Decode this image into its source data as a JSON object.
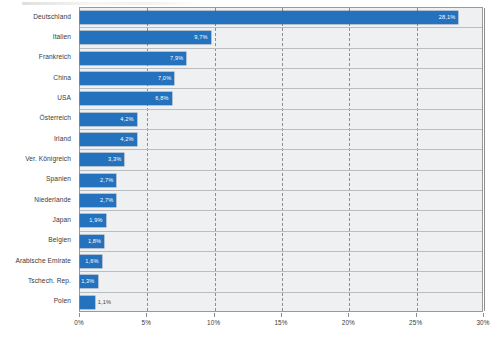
{
  "chart_data": {
    "type": "bar",
    "orientation": "horizontal",
    "title": "",
    "subtitle": "",
    "xlabel": "",
    "ylabel": "",
    "xlim": [
      0,
      30
    ],
    "grid": true,
    "legend": null,
    "value_suffix": "%",
    "decimal_separator": ",",
    "categories": [
      "Deutschland",
      "Italien",
      "Frankreich",
      "China",
      "USA",
      "Österreich",
      "Irland",
      "Ver. Königreich",
      "Spanien",
      "Niederlande",
      "Japan",
      "Belgien",
      "Arabische Emirate",
      "Tschech. Rep.",
      "Polen"
    ],
    "values": [
      28.1,
      9.7,
      7.9,
      7.0,
      6.8,
      4.2,
      4.2,
      3.3,
      2.7,
      2.7,
      1.9,
      1.8,
      1.6,
      1.3,
      1.1
    ],
    "value_labels": [
      "28,1%",
      "9,7%",
      "7,9%",
      "7,0%",
      "6,8%",
      "4,2%",
      "4,2%",
      "3,3%",
      "2,7%",
      "2,7%",
      "1,9%",
      "1,8%",
      "1,6%",
      "1,3%",
      "1,1%"
    ],
    "label_placement": [
      "inside",
      "inside",
      "inside",
      "inside",
      "inside",
      "inside",
      "inside",
      "inside",
      "inside",
      "inside",
      "inside",
      "inside",
      "inside",
      "inside",
      "outside"
    ],
    "xticks": [
      0,
      5,
      10,
      15,
      20,
      25,
      30
    ],
    "xtick_labels": [
      "0%",
      "5%",
      "10%",
      "15%",
      "20%",
      "25%",
      "30%"
    ],
    "colors": {
      "bar": "#2471bd",
      "plot_background": "#eff0f1",
      "gridline": "#8e8e8e",
      "row_separator": "#b9bcc0",
      "axis_text": "#3a3a3a",
      "value_text_inside": "#ffffff",
      "value_text_outside": "#3f3f3f"
    }
  }
}
